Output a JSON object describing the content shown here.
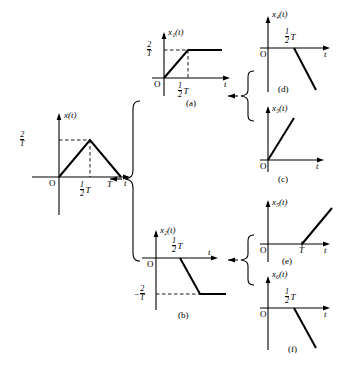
{
  "figure": {
    "line_color": "#000000",
    "dash_color": "#000000",
    "background": "#ffffff"
  },
  "source": {
    "name": "source-signal",
    "ylabel": "x(t)",
    "origin_label": "O",
    "taxis_label": "t",
    "amplitude": {
      "numerator": "2",
      "denominator": "T",
      "sign": ""
    },
    "ticks": [
      {
        "label_num": "1",
        "label_den": "2",
        "label_tail": "T"
      },
      {
        "label": "T"
      }
    ]
  },
  "panels": [
    {
      "key": "a",
      "caption": "(a)",
      "ylabel": "x₁(t)",
      "ylabel_base": "x",
      "ylabel_sub": "1",
      "ylabel_tail": "(t)",
      "origin_label": "O",
      "taxis_label": "t",
      "amplitude": {
        "numerator": "2",
        "denominator": "T",
        "sign": ""
      },
      "tick": {
        "num": "1",
        "den": "2",
        "tail": "T"
      },
      "shape": "ramp-up-then-constant"
    },
    {
      "key": "b",
      "caption": "(b)",
      "ylabel": "x₂(t)",
      "ylabel_base": "x",
      "ylabel_sub": "2",
      "ylabel_tail": "(t)",
      "origin_label": "O",
      "taxis_label": "t",
      "amplitude": {
        "numerator": "2",
        "denominator": "T",
        "sign": "−"
      },
      "tick": {
        "num": "1",
        "den": "2",
        "tail": "T"
      },
      "shape": "ramp-down-then-constant-negative"
    },
    {
      "key": "c",
      "caption": "(c)",
      "ylabel": "x₃(t)",
      "ylabel_base": "x",
      "ylabel_sub": "3",
      "ylabel_tail": "(t)",
      "origin_label": "O",
      "taxis_label": "t",
      "tick": null,
      "shape": "ramp-up-from-origin"
    },
    {
      "key": "d",
      "caption": "(d)",
      "ylabel": "x₄(t)",
      "ylabel_base": "x",
      "ylabel_sub": "4",
      "ylabel_tail": "(t)",
      "origin_label": "O",
      "taxis_label": "t",
      "tick": {
        "num": "1",
        "den": "2",
        "tail": "T"
      },
      "shape": "ramp-down-from-half-T"
    },
    {
      "key": "e",
      "caption": "(e)",
      "ylabel": "x₅(t)",
      "ylabel_base": "x",
      "ylabel_sub": "5",
      "ylabel_tail": "(t)",
      "origin_label": "O",
      "taxis_label": "t",
      "tick": {
        "label": "T"
      },
      "shape": "ramp-up-from-T"
    },
    {
      "key": "f",
      "caption": "(f)",
      "ylabel": "x₆(t)",
      "ylabel_base": "x",
      "ylabel_sub": "6",
      "ylabel_tail": "(t)",
      "origin_label": "O",
      "taxis_label": "t",
      "tick": {
        "num": "1",
        "den": "2",
        "tail": "T"
      },
      "shape": "ramp-down-from-half-T"
    }
  ],
  "connectors": [
    {
      "name": "main-split-brace",
      "kind": "brace-with-arrow"
    },
    {
      "name": "upper-split-brace",
      "kind": "brace-with-arrow"
    },
    {
      "name": "lower-split-brace",
      "kind": "brace-with-arrow"
    }
  ]
}
